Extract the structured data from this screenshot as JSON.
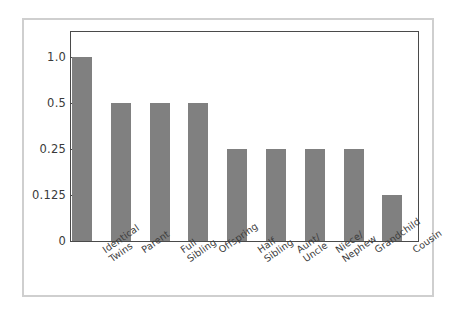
{
  "chart_data": {
    "type": "bar",
    "title": "",
    "subtitle": "",
    "xlabel": "",
    "ylabel": "",
    "categories": [
      "Identical Twins",
      "Parent",
      "Full Sibling",
      "Offspring",
      "Half Sibling",
      "Aunt/ Uncle",
      "Niece/ Nephew",
      "Grandchild",
      "Cousin"
    ],
    "category_lines": [
      [
        "Identical",
        "Twins"
      ],
      [
        "Parent"
      ],
      [
        "Full",
        "Sibling"
      ],
      [
        "Offspring"
      ],
      [
        "Half",
        "Sibling"
      ],
      [
        "Aunt/",
        "Uncle"
      ],
      [
        "Niece/",
        "Nephew"
      ],
      [
        "Grandchild"
      ],
      [
        "Cousin"
      ]
    ],
    "values": [
      1.0,
      0.5,
      0.5,
      0.5,
      0.25,
      0.25,
      0.25,
      0.25,
      0.125
    ],
    "ytick_labels": [
      "1.0",
      "0.5",
      "0.25",
      "0.125",
      "0"
    ],
    "ytick_values": [
      1.0,
      0.5,
      0.25,
      0.125,
      0
    ],
    "ylim": [
      0,
      1.0
    ],
    "yscale": "log2",
    "grid": false,
    "legend": false,
    "bar_color": "#808080",
    "axis_color": "#4a4a4a",
    "frame_color": "#cfcfcf",
    "background_color": "#ffffff"
  }
}
